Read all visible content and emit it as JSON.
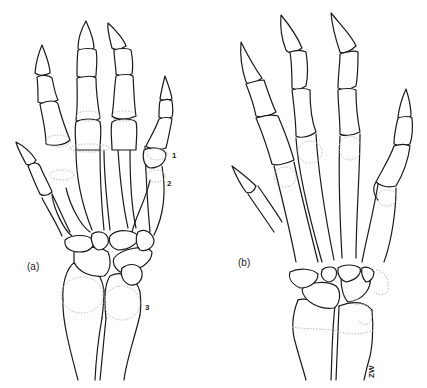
{
  "figure": {
    "panels": [
      {
        "id": "a",
        "label": "(a)"
      },
      {
        "id": "b",
        "label": "(b)"
      }
    ],
    "markers": [
      {
        "label": "1"
      },
      {
        "label": "2"
      },
      {
        "label": "3"
      }
    ],
    "signature": "ZW",
    "colors": {
      "line": "#1a1a1a",
      "ossification_dotted": "#b8b8b8",
      "background": "#ffffff"
    }
  }
}
